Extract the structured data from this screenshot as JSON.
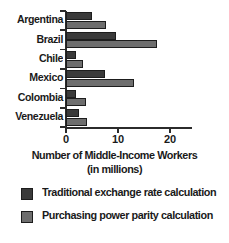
{
  "chart_data": {
    "type": "bar",
    "orientation": "horizontal",
    "title": "",
    "xlabel": "Number of Middle-Income Workers (in millions)",
    "xlabel_lines": [
      "Number of Middle-Income Workers",
      "(in millions)"
    ],
    "ylabel": "",
    "xlim": [
      0,
      24
    ],
    "xticks": [
      0,
      10,
      20
    ],
    "xtick_labels": [
      "0",
      "10",
      "20"
    ],
    "grid": false,
    "legend_position": "bottom-left",
    "categories": [
      "Argentina",
      "Brazil",
      "Chile",
      "Mexico",
      "Colombia",
      "Venezuela"
    ],
    "series": [
      {
        "name": "Traditional exchange rate calculation",
        "color": "#3a3a3a",
        "values": [
          5.0,
          9.6,
          1.9,
          7.5,
          1.9,
          2.5
        ]
      },
      {
        "name": "Purchasing power parity calculation",
        "color": "#6e6e6e",
        "values": [
          7.7,
          17.5,
          3.3,
          13.1,
          3.8,
          4.0
        ]
      }
    ]
  },
  "legend": {
    "items": [
      {
        "label": "Traditional exchange rate calculation",
        "color": "#3a3a3a"
      },
      {
        "label": "Purchasing power parity calculation",
        "color": "#6e6e6e"
      }
    ]
  }
}
